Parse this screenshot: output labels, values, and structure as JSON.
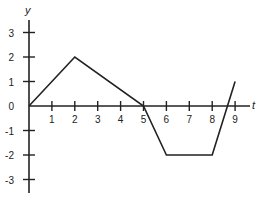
{
  "chart_data": {
    "type": "line",
    "title": "",
    "xlabel": "t",
    "ylabel": "y",
    "xlim": [
      0,
      9.7
    ],
    "ylim": [
      -3.5,
      3.5
    ],
    "x_ticks": [
      1,
      2,
      3,
      4,
      5,
      6,
      7,
      8,
      9
    ],
    "y_ticks": [
      3,
      2,
      1,
      0,
      -1,
      -2,
      -3
    ],
    "grid": false,
    "legend": null,
    "series": [
      {
        "name": "y(t)",
        "x": [
          0,
          2,
          5,
          6,
          8,
          9
        ],
        "values": [
          0,
          2,
          0,
          -2,
          -2,
          1
        ],
        "color": "#222222"
      }
    ]
  },
  "labels": {
    "x_axis": "t",
    "y_axis": "y",
    "x_ticks": [
      "1",
      "2",
      "3",
      "4",
      "5",
      "6",
      "7",
      "8",
      "9"
    ],
    "y_ticks": [
      "3",
      "2",
      "1",
      "0",
      "-1",
      "-2",
      "-3"
    ]
  }
}
